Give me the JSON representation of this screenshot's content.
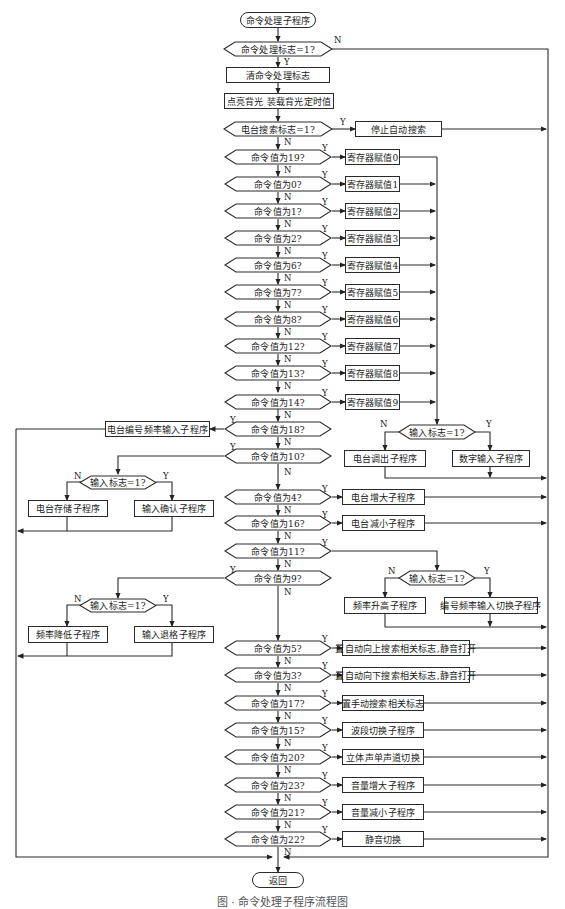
{
  "start": "命令处理子程序",
  "end": "返回",
  "steps": {
    "flag_check": "命令处理标志=1?",
    "clear_flag": "清命令处理标志",
    "backlight": "点亮背光  装载背光定时值",
    "search_check": "电台搜索标志=1?",
    "stop_search": "停止自动搜索"
  },
  "register_branches": [
    {
      "cond": "命令值为19?",
      "action": "寄存器赋值0"
    },
    {
      "cond": "命令值为0?",
      "action": "寄存器赋值1"
    },
    {
      "cond": "命令值为1?",
      "action": "寄存器赋值2"
    },
    {
      "cond": "命令值为2?",
      "action": "寄存器赋值3"
    },
    {
      "cond": "命令值为6?",
      "action": "寄存器赋值4"
    },
    {
      "cond": "命令值为7?",
      "action": "寄存器赋值5"
    },
    {
      "cond": "命令值为8?",
      "action": "寄存器赋值6"
    },
    {
      "cond": "命令值为12?",
      "action": "寄存器赋值7"
    },
    {
      "cond": "命令值为13?",
      "action": "寄存器赋值8"
    },
    {
      "cond": "命令值为14?",
      "action": "寄存器赋值9"
    }
  ],
  "input_flag_right_1": {
    "cond": "输入标志=1?",
    "no": "电台调出子程序",
    "yes": "数字输入子程序"
  },
  "cmd18": {
    "cond": "命令值为18?",
    "action": "电台编号频率输入子程序"
  },
  "cmd10": {
    "cond": "命令值为10?",
    "sub": {
      "cond": "输入标志=1?",
      "no": "电台存储子程序",
      "yes": "输入确认子程序"
    }
  },
  "cmd4": {
    "cond": "命令值为4?",
    "action": "电台增大子程序"
  },
  "cmd16": {
    "cond": "命令值为16?",
    "action": "电台减小子程序"
  },
  "cmd11": {
    "cond": "命令值为11?",
    "sub": {
      "cond": "输入标志=1?",
      "no": "频率升高子程序",
      "yes": "编号频率输入切换子程序"
    }
  },
  "cmd9": {
    "cond": "命令值为9?",
    "sub": {
      "cond": "输入标志=1?",
      "no": "频率降低子程序",
      "yes": "输入退格子程序"
    }
  },
  "tail_branches": [
    {
      "cond": "命令值为5?",
      "action": "置自动向上搜索相关标志,静音打开"
    },
    {
      "cond": "命令值为3?",
      "action": "置自动向下搜索相关标志,静音打开"
    },
    {
      "cond": "命令值为17?",
      "action": "置手动搜索相关标志"
    },
    {
      "cond": "命令值为15?",
      "action": "波段切换子程序"
    },
    {
      "cond": "命令值为20?",
      "action": "立体声单声道切换"
    },
    {
      "cond": "命令值为23?",
      "action": "音量增大子程序"
    },
    {
      "cond": "命令值为21?",
      "action": "音量减小子程序"
    },
    {
      "cond": "命令值为22?",
      "action": "静音切换"
    }
  ],
  "labels": {
    "yes": "Y",
    "no": "N"
  },
  "caption": "图 ·  命令处理子程序流程图"
}
